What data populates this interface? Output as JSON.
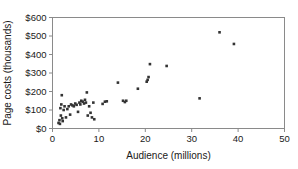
{
  "chart_data": {
    "type": "scatter",
    "title": "",
    "xlabel": "Audience (millions)",
    "ylabel": "Page costs (thousands)",
    "xlim": [
      0,
      50
    ],
    "ylim": [
      0,
      600
    ],
    "xticks": [
      0,
      10,
      20,
      30,
      40,
      50
    ],
    "yticks": [
      0,
      100,
      200,
      300,
      400,
      500,
      600
    ],
    "xtick_labels": [
      "0",
      "10",
      "20",
      "30",
      "40",
      "50"
    ],
    "ytick_labels": [
      "$0",
      "$100",
      "$200",
      "$300",
      "$400",
      "$500",
      "$600"
    ],
    "grid": false,
    "legend": null,
    "marker_color": "#333333",
    "axis_color": "#8a8a8a",
    "points": [
      [
        1.3,
        30
      ],
      [
        1.5,
        45
      ],
      [
        1.6,
        25
      ],
      [
        1.7,
        110
      ],
      [
        1.8,
        70
      ],
      [
        1.9,
        130
      ],
      [
        2.0,
        180
      ],
      [
        2.1,
        55
      ],
      [
        2.2,
        40
      ],
      [
        2.4,
        100
      ],
      [
        2.6,
        120
      ],
      [
        2.9,
        60
      ],
      [
        3.2,
        105
      ],
      [
        3.5,
        120
      ],
      [
        3.8,
        75
      ],
      [
        4.0,
        130
      ],
      [
        4.3,
        125
      ],
      [
        4.6,
        120
      ],
      [
        4.9,
        135
      ],
      [
        5.2,
        128
      ],
      [
        5.5,
        90
      ],
      [
        5.8,
        140
      ],
      [
        6.0,
        130
      ],
      [
        6.2,
        150
      ],
      [
        6.5,
        145
      ],
      [
        6.8,
        135
      ],
      [
        7.0,
        155
      ],
      [
        7.2,
        140
      ],
      [
        7.4,
        195
      ],
      [
        7.6,
        70
      ],
      [
        7.9,
        120
      ],
      [
        8.2,
        85
      ],
      [
        8.5,
        60
      ],
      [
        8.8,
        140
      ],
      [
        9.0,
        50
      ],
      [
        10.8,
        133
      ],
      [
        11.3,
        145
      ],
      [
        11.7,
        147
      ],
      [
        14.1,
        248
      ],
      [
        15.2,
        150
      ],
      [
        15.6,
        143
      ],
      [
        15.9,
        150
      ],
      [
        18.4,
        215
      ],
      [
        20.3,
        253
      ],
      [
        20.5,
        263
      ],
      [
        20.7,
        278
      ],
      [
        21.0,
        348
      ],
      [
        24.6,
        338
      ],
      [
        31.7,
        163
      ],
      [
        36.0,
        520
      ],
      [
        39.1,
        457
      ]
    ]
  }
}
